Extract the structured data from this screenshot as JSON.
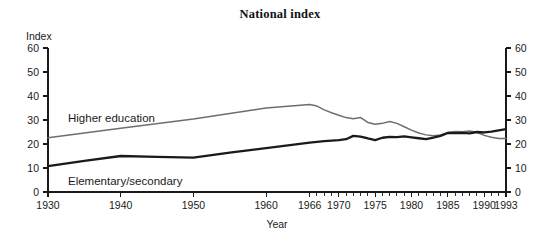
{
  "chart_data": {
    "type": "line",
    "title": "National index",
    "xlabel": "Year",
    "ylabel": "Index",
    "ylim": [
      0,
      60
    ],
    "xlim": [
      1930,
      1993
    ],
    "grid": false,
    "legend_position": "inline-labels",
    "yticks": [
      0,
      10,
      20,
      30,
      40,
      50,
      60
    ],
    "yticks_right": [
      0,
      10,
      20,
      30,
      40,
      50,
      60
    ],
    "xticks_labeled": [
      1930,
      1940,
      1950,
      1960,
      1966,
      1970,
      1975,
      1980,
      1985,
      1990,
      1993
    ],
    "xticks_minor_note": "annual ticks from 1966 to 1993",
    "series": [
      {
        "name": "Higher education",
        "color": "#6e6e6e",
        "linewidth": 1.5,
        "x": [
          1930,
          1940,
          1950,
          1960,
          1966,
          1967,
          1968,
          1969,
          1970,
          1971,
          1972,
          1973,
          1974,
          1975,
          1976,
          1977,
          1978,
          1979,
          1980,
          1981,
          1982,
          1983,
          1984,
          1985,
          1986,
          1987,
          1988,
          1989,
          1990,
          1991,
          1992,
          1993
        ],
        "values": [
          22.6,
          26.6,
          30.4,
          35.0,
          36.5,
          35.8,
          34.2,
          33.0,
          32.0,
          31.0,
          30.5,
          31.0,
          29.0,
          28.2,
          28.6,
          29.4,
          28.6,
          27.2,
          25.8,
          24.6,
          23.8,
          23.4,
          23.8,
          24.8,
          25.2,
          25.1,
          25.4,
          24.9,
          23.6,
          22.8,
          22.3,
          22.3
        ]
      },
      {
        "name": "Elementary/secondary",
        "color": "#1a1a1a",
        "linewidth": 2.3,
        "x": [
          1930,
          1935,
          1940,
          1945,
          1950,
          1955,
          1960,
          1966,
          1968,
          1970,
          1971,
          1972,
          1973,
          1974,
          1975,
          1976,
          1977,
          1978,
          1979,
          1980,
          1981,
          1982,
          1983,
          1984,
          1985,
          1986,
          1987,
          1988,
          1989,
          1990,
          1991,
          1992,
          1993
        ],
        "values": [
          10.8,
          13.0,
          15.0,
          14.6,
          14.3,
          16.4,
          18.3,
          20.6,
          21.2,
          21.6,
          22.0,
          23.4,
          23.1,
          22.3,
          21.6,
          22.6,
          23.0,
          22.9,
          23.2,
          22.8,
          22.4,
          22.0,
          22.7,
          23.4,
          24.6,
          24.5,
          24.6,
          24.4,
          25.0,
          24.8,
          25.2,
          25.7,
          26.2
        ]
      }
    ],
    "annotations": [
      {
        "text": "Higher education",
        "x_px": 68,
        "y_px": 122
      },
      {
        "text": "Elementary/secondary",
        "x_px": 68,
        "y_px": 185
      }
    ]
  },
  "axis": {
    "left_title": "Index",
    "bottom_title": "Year"
  }
}
